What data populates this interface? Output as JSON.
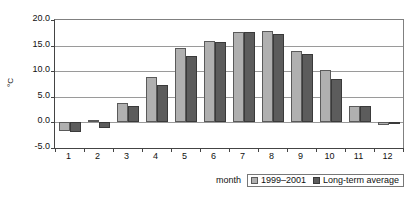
{
  "chart_data": {
    "type": "bar",
    "title": "",
    "subtitle": "",
    "xlabel": "month",
    "ylabel": "°C",
    "categories": [
      "1",
      "2",
      "3",
      "4",
      "5",
      "6",
      "7",
      "8",
      "9",
      "10",
      "11",
      "12"
    ],
    "series": [
      {
        "name": "1999–2001",
        "color": "#b0b0b0",
        "values": [
          -1.7,
          0.5,
          3.7,
          8.8,
          14.5,
          15.9,
          17.6,
          17.8,
          14.0,
          10.3,
          3.3,
          -0.5
        ]
      },
      {
        "name": "Long-term average",
        "color": "#5c5c5c",
        "values": [
          -1.9,
          -1.0,
          3.3,
          7.4,
          13.0,
          15.7,
          17.6,
          17.3,
          13.4,
          8.4,
          3.2,
          -0.2
        ]
      }
    ],
    "ylim": [
      -5.0,
      20.0
    ],
    "ytick_step": 5.0,
    "yticks": [
      "20.0",
      "15.0",
      "10.0",
      "5.0",
      "0.0",
      "-5.0"
    ],
    "ytick_values": [
      20.0,
      15.0,
      10.0,
      5.0,
      0.0,
      -5.0
    ],
    "grid": true,
    "grid_axis": "y",
    "legend_position": "bottom-right",
    "plot_border": true
  },
  "axes": {
    "y_title": "°C",
    "x_title": "month"
  },
  "legend": {
    "items": [
      {
        "label": "1999–2001",
        "color": "#b0b0b0"
      },
      {
        "label": "Long-term average",
        "color": "#5c5c5c"
      }
    ]
  }
}
